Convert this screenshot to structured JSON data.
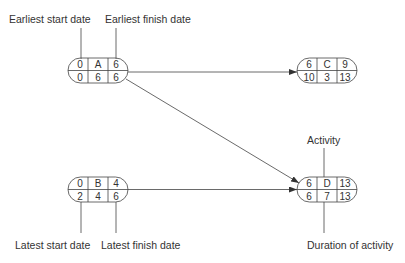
{
  "labels": {
    "earliest_start": "Earliest start date",
    "earliest_finish": "Earliest finish date",
    "latest_start": "Latest start date",
    "latest_finish": "Latest finish date",
    "activity": "Activity",
    "duration": "Duration of activity"
  },
  "nodes": {
    "A": {
      "es": "0",
      "name": "A",
      "ef": "6",
      "ls": "0",
      "dur": "6",
      "lf": "6"
    },
    "B": {
      "es": "0",
      "name": "B",
      "ef": "4",
      "ls": "2",
      "dur": "4",
      "lf": "6"
    },
    "C": {
      "es": "6",
      "name": "C",
      "ef": "9",
      "ls": "10",
      "dur": "3",
      "lf": "13"
    },
    "D": {
      "es": "6",
      "name": "D",
      "ef": "13",
      "ls": "6",
      "dur": "7",
      "lf": "13"
    }
  },
  "edges": [
    {
      "from": "A",
      "to": "C"
    },
    {
      "from": "A",
      "to": "D"
    },
    {
      "from": "B",
      "to": "D"
    }
  ],
  "colors": {
    "line": "#444444",
    "text": "#333333",
    "background": "#ffffff"
  }
}
